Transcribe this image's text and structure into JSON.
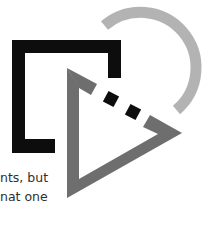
{
  "figure": {
    "shapes": {
      "bracket": {
        "name": "open-square-bracket",
        "color": "#0d0d0d"
      },
      "arc": {
        "name": "partial-circle-arc",
        "color": "#b3b3b3"
      },
      "triangle": {
        "name": "broken-triangle",
        "color": "#6e6e6e"
      },
      "dots": {
        "name": "gap-dots",
        "color": "#0d0d0d",
        "count": 2
      }
    }
  },
  "text": {
    "lines": [
      "nts, but",
      "nat one"
    ]
  }
}
